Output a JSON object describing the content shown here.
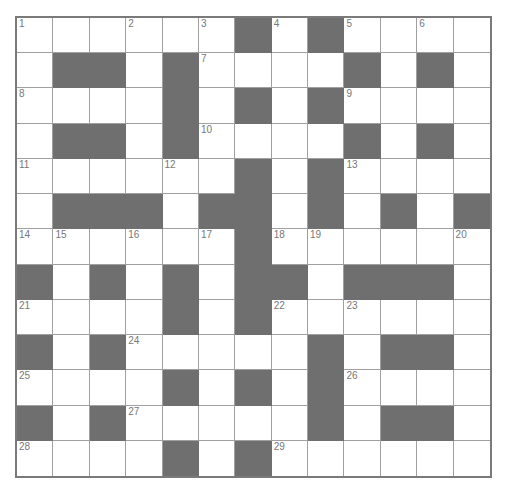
{
  "puzzle": {
    "rows": 13,
    "cols": 13,
    "colors": {
      "block": "#6f6f6f",
      "cell": "#ffffff",
      "line": "#a0a0a0",
      "border": "#7a7a7a",
      "number": "#777777"
    },
    "layout": [
      "......#.#....",
      ".##.#....#.#.",
      "....#.#.#....",
      ".##.#....#.#.",
      "......#.#....",
      ".###.##.#.#.#",
      "......#......",
      "#.#.#.##.###.",
      "....#.#......",
      "#.#.....#.##.",
      "....#.#.#....",
      "#.#.....#.##.",
      "....#.#......"
    ],
    "numbers": [
      {
        "r": 0,
        "c": 0,
        "n": "1"
      },
      {
        "r": 0,
        "c": 3,
        "n": "2"
      },
      {
        "r": 0,
        "c": 5,
        "n": "3"
      },
      {
        "r": 0,
        "c": 7,
        "n": "4"
      },
      {
        "r": 0,
        "c": 9,
        "n": "5"
      },
      {
        "r": 0,
        "c": 11,
        "n": "6"
      },
      {
        "r": 1,
        "c": 5,
        "n": "7"
      },
      {
        "r": 2,
        "c": 0,
        "n": "8"
      },
      {
        "r": 2,
        "c": 9,
        "n": "9"
      },
      {
        "r": 3,
        "c": 5,
        "n": "10"
      },
      {
        "r": 4,
        "c": 0,
        "n": "11"
      },
      {
        "r": 4,
        "c": 4,
        "n": "12"
      },
      {
        "r": 4,
        "c": 9,
        "n": "13"
      },
      {
        "r": 6,
        "c": 0,
        "n": "14"
      },
      {
        "r": 6,
        "c": 1,
        "n": "15"
      },
      {
        "r": 6,
        "c": 3,
        "n": "16"
      },
      {
        "r": 6,
        "c": 5,
        "n": "17"
      },
      {
        "r": 6,
        "c": 7,
        "n": "18"
      },
      {
        "r": 6,
        "c": 8,
        "n": "19"
      },
      {
        "r": 6,
        "c": 12,
        "n": "20"
      },
      {
        "r": 8,
        "c": 0,
        "n": "21"
      },
      {
        "r": 8,
        "c": 7,
        "n": "22"
      },
      {
        "r": 8,
        "c": 9,
        "n": "23"
      },
      {
        "r": 9,
        "c": 3,
        "n": "24"
      },
      {
        "r": 10,
        "c": 0,
        "n": "25"
      },
      {
        "r": 10,
        "c": 9,
        "n": "26"
      },
      {
        "r": 11,
        "c": 3,
        "n": "27"
      },
      {
        "r": 12,
        "c": 0,
        "n": "28"
      },
      {
        "r": 12,
        "c": 7,
        "n": "29"
      }
    ]
  }
}
